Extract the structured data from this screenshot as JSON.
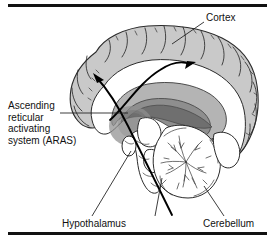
{
  "figure": {
    "type": "anatomical-diagram",
    "width": 275,
    "height": 244,
    "background_color": "#ffffff",
    "rules": {
      "top_rule_color": "#111111",
      "bottom_rule_color": "#111111"
    }
  },
  "labels": {
    "cortex": {
      "text": "Cortex",
      "position": "top-right"
    },
    "aras": {
      "line1": "Ascending",
      "line2": "reticular",
      "line3": "activating",
      "line4": "system (ARAS)",
      "full_text": "Ascending reticular activating system (ARAS)",
      "position": "left-middle"
    },
    "hypothalamus": {
      "text": "Hypothalamus",
      "position": "bottom-left"
    },
    "cerebellum": {
      "text": "Cerebellum",
      "position": "bottom-right"
    }
  },
  "structures": {
    "cortex_fill": "#c9c9c9",
    "aras_core_fill": "#8e8e8e",
    "thalamus_fill": "#6f6f6f",
    "white_matter_fill": "#ffffff",
    "outline_color": "#2b2b2b",
    "arrow_color": "#000000"
  },
  "arrows": {
    "count": 2,
    "description": "Two black curved projection arrows ascending from the reticular core to the cortex",
    "left_arrow": "ascending projection to frontal cortex",
    "right_arrow": "ascending projection to parietal cortex"
  }
}
